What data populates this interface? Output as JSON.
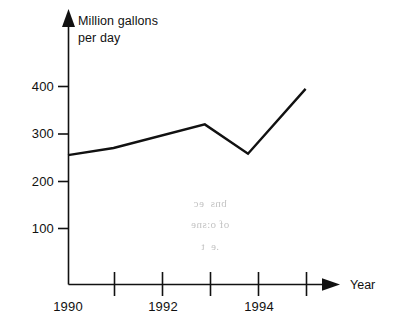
{
  "chart_data": {
    "type": "line",
    "title": "",
    "subtitle": "",
    "xlabel": "Year",
    "ylabel": "Million gallons per day",
    "ylabel_line1": "Million gallons",
    "ylabel_line2": "per day",
    "x": [
      1990,
      1990.95,
      1992.85,
      1993.75,
      1994.95
    ],
    "values": [
      255,
      270,
      320,
      258,
      395
    ],
    "series": [
      {
        "name": "Million gallons per day",
        "points": [
          {
            "x": 1990,
            "y": 255
          },
          {
            "x": 1990.95,
            "y": 270
          },
          {
            "x": 1992.85,
            "y": 320
          },
          {
            "x": 1993.75,
            "y": 258
          },
          {
            "x": 1994.95,
            "y": 395
          }
        ]
      }
    ],
    "xlim": [
      1990,
      1995.6
    ],
    "ylim": [
      0,
      430
    ],
    "y_ticks": [
      100,
      200,
      300,
      400
    ],
    "y_tick_labels": [
      "100",
      "200",
      "300",
      "400"
    ],
    "x_ticks": [
      1990,
      1990.5,
      1991,
      1991.5,
      1992,
      1992.5,
      1993,
      1993.5,
      1994,
      1994.5,
      1995
    ],
    "x_tick_labels": [
      "1990",
      "",
      "1992",
      "",
      "1994",
      ""
    ],
    "x_labeled_ticks": [
      {
        "value": 1990,
        "label": "1990"
      },
      {
        "value": 1992,
        "label": "1992"
      },
      {
        "value": 1994,
        "label": "1994"
      }
    ],
    "grid": false,
    "legend": false,
    "legend_position": "none",
    "line_color": "#111111",
    "axis_color": "#111111",
    "background_color": "#ffffff",
    "annotations": []
  },
  "axes": {
    "y_axis_label_line1": "Million gallons",
    "y_axis_label_line2": "per day",
    "x_axis_label": "Year",
    "y_tick_labels": [
      "400",
      "300",
      "200",
      "100"
    ],
    "x_tick_labels": [
      "1990",
      "1992",
      "1994"
    ]
  },
  "artifacts": {
    "bleed_through_line1": "bns  ec",
    "bleed_through_line2": "of o:sne",
    "bleed_through_line3": ".e  t"
  }
}
